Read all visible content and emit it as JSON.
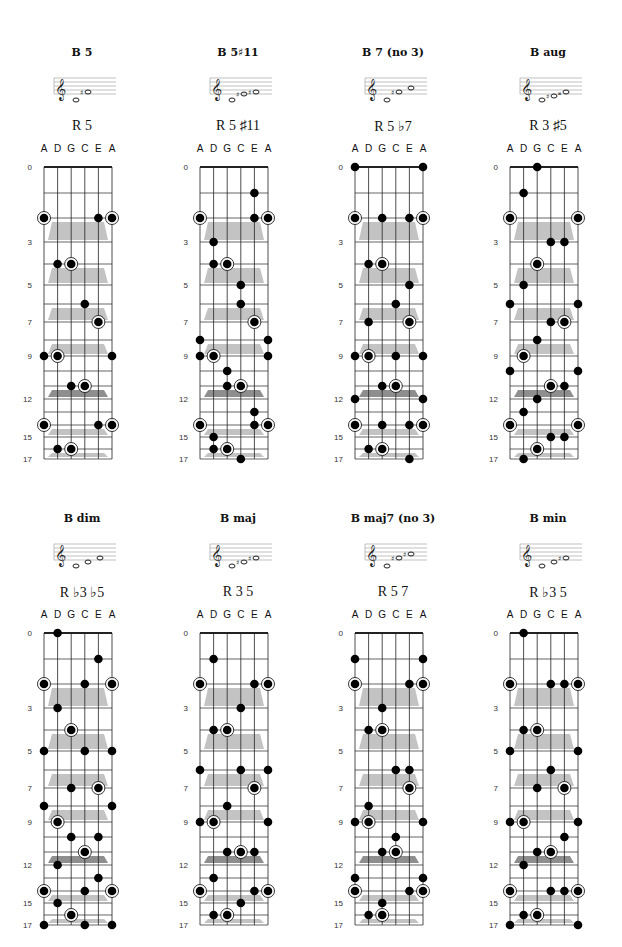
{
  "tuning": [
    "A",
    "D",
    "G",
    "C",
    "E",
    "A"
  ],
  "fret_labels": [
    0,
    3,
    5,
    7,
    9,
    12,
    15,
    17
  ],
  "colors": {
    "dot": "#000000",
    "shade": "#b8b8b8",
    "shade_dark": "#7a7a7a",
    "grid": "#222222"
  },
  "chart_data": {
    "type": "diagram",
    "charts": [
      {
        "title": "B 5",
        "formula": "R 5",
        "notes": [
          "B",
          "F#"
        ],
        "dots": [
          [
            0,
            2,
            1
          ],
          [
            4,
            2,
            0
          ],
          [
            5,
            2,
            1
          ],
          [
            1,
            4,
            0
          ],
          [
            2,
            4,
            1
          ],
          [
            3,
            6,
            0
          ],
          [
            4,
            7,
            1
          ],
          [
            0,
            9,
            0
          ],
          [
            1,
            9,
            1
          ],
          [
            5,
            9,
            0
          ],
          [
            2,
            11,
            0
          ],
          [
            3,
            11,
            1
          ],
          [
            0,
            14,
            1
          ],
          [
            4,
            14,
            0
          ],
          [
            5,
            14,
            1
          ],
          [
            1,
            16,
            0
          ],
          [
            2,
            16,
            1
          ]
        ]
      },
      {
        "title": "B 5♯11",
        "formula": "R 5 ♯11",
        "notes": [
          "B",
          "E#",
          "F#"
        ],
        "dots": [
          [
            4,
            1,
            0
          ],
          [
            0,
            2,
            1
          ],
          [
            4,
            2,
            0
          ],
          [
            5,
            2,
            1
          ],
          [
            1,
            3,
            0
          ],
          [
            1,
            4,
            0
          ],
          [
            2,
            4,
            1
          ],
          [
            3,
            5,
            0
          ],
          [
            3,
            6,
            0
          ],
          [
            4,
            7,
            1
          ],
          [
            0,
            8,
            0
          ],
          [
            5,
            8,
            0
          ],
          [
            0,
            9,
            0
          ],
          [
            1,
            9,
            1
          ],
          [
            5,
            9,
            0
          ],
          [
            2,
            10,
            0
          ],
          [
            2,
            11,
            0
          ],
          [
            3,
            11,
            1
          ],
          [
            4,
            13,
            0
          ],
          [
            0,
            14,
            1
          ],
          [
            4,
            14,
            0
          ],
          [
            5,
            14,
            1
          ],
          [
            1,
            15,
            0
          ],
          [
            1,
            16,
            0
          ],
          [
            2,
            16,
            1
          ],
          [
            3,
            17,
            0
          ]
        ]
      },
      {
        "title": "B 7 (no 3)",
        "formula": "R 5 ♭7",
        "notes": [
          "B",
          "F#",
          "A"
        ],
        "dots": [
          [
            0,
            0,
            0
          ],
          [
            5,
            0,
            0
          ],
          [
            0,
            2,
            1
          ],
          [
            2,
            2,
            0
          ],
          [
            4,
            2,
            0
          ],
          [
            5,
            2,
            1
          ],
          [
            1,
            4,
            0
          ],
          [
            2,
            4,
            1
          ],
          [
            4,
            5,
            0
          ],
          [
            3,
            6,
            0
          ],
          [
            1,
            7,
            0
          ],
          [
            4,
            7,
            1
          ],
          [
            0,
            9,
            0
          ],
          [
            1,
            9,
            1
          ],
          [
            3,
            9,
            0
          ],
          [
            5,
            9,
            0
          ],
          [
            2,
            11,
            0
          ],
          [
            3,
            11,
            1
          ],
          [
            0,
            12,
            0
          ],
          [
            5,
            12,
            0
          ],
          [
            0,
            14,
            1
          ],
          [
            2,
            14,
            0
          ],
          [
            4,
            14,
            0
          ],
          [
            5,
            14,
            1
          ],
          [
            1,
            16,
            0
          ],
          [
            2,
            16,
            1
          ],
          [
            4,
            17,
            0
          ]
        ]
      },
      {
        "title": "B aug",
        "formula": "R 3 ♯5",
        "notes": [
          "B",
          "D#",
          "F##"
        ],
        "dots": [
          [
            2,
            0,
            0
          ],
          [
            1,
            1,
            0
          ],
          [
            0,
            2,
            1
          ],
          [
            5,
            2,
            1
          ],
          [
            3,
            3,
            0
          ],
          [
            4,
            3,
            0
          ],
          [
            2,
            4,
            1
          ],
          [
            1,
            5,
            0
          ],
          [
            0,
            6,
            0
          ],
          [
            5,
            6,
            0
          ],
          [
            3,
            7,
            0
          ],
          [
            4,
            7,
            1
          ],
          [
            2,
            8,
            0
          ],
          [
            1,
            9,
            1
          ],
          [
            0,
            10,
            0
          ],
          [
            5,
            10,
            0
          ],
          [
            3,
            11,
            1
          ],
          [
            4,
            11,
            0
          ],
          [
            2,
            12,
            0
          ],
          [
            1,
            13,
            0
          ],
          [
            0,
            14,
            1
          ],
          [
            5,
            14,
            1
          ],
          [
            3,
            15,
            0
          ],
          [
            4,
            15,
            0
          ],
          [
            2,
            16,
            1
          ],
          [
            1,
            17,
            0
          ]
        ]
      },
      {
        "title": "B dim",
        "formula": "R ♭3 ♭5",
        "notes": [
          "B",
          "D",
          "F"
        ],
        "dots": [
          [
            1,
            0,
            0
          ],
          [
            4,
            1,
            0
          ],
          [
            0,
            2,
            1
          ],
          [
            3,
            2,
            0
          ],
          [
            5,
            2,
            1
          ],
          [
            1,
            3,
            0
          ],
          [
            2,
            4,
            1
          ],
          [
            0,
            5,
            0
          ],
          [
            3,
            5,
            0
          ],
          [
            5,
            5,
            0
          ],
          [
            2,
            7,
            0
          ],
          [
            4,
            7,
            1
          ],
          [
            0,
            8,
            0
          ],
          [
            5,
            8,
            0
          ],
          [
            1,
            9,
            1
          ],
          [
            2,
            10,
            0
          ],
          [
            4,
            10,
            0
          ],
          [
            3,
            11,
            1
          ],
          [
            1,
            12,
            0
          ],
          [
            4,
            13,
            0
          ],
          [
            0,
            14,
            1
          ],
          [
            3,
            14,
            0
          ],
          [
            5,
            14,
            1
          ],
          [
            1,
            15,
            0
          ],
          [
            2,
            16,
            1
          ],
          [
            0,
            17,
            0
          ],
          [
            3,
            17,
            0
          ],
          [
            5,
            17,
            0
          ]
        ]
      },
      {
        "title": "B maj",
        "formula": "R 3 5",
        "notes": [
          "B",
          "D#",
          "F#"
        ],
        "dots": [
          [
            1,
            1,
            0
          ],
          [
            0,
            2,
            1
          ],
          [
            4,
            2,
            0
          ],
          [
            5,
            2,
            1
          ],
          [
            3,
            3,
            0
          ],
          [
            1,
            4,
            0
          ],
          [
            2,
            4,
            1
          ],
          [
            0,
            6,
            0
          ],
          [
            3,
            6,
            0
          ],
          [
            5,
            6,
            0
          ],
          [
            4,
            7,
            1
          ],
          [
            2,
            8,
            0
          ],
          [
            0,
            9,
            0
          ],
          [
            1,
            9,
            1
          ],
          [
            5,
            9,
            0
          ],
          [
            2,
            11,
            0
          ],
          [
            3,
            11,
            1
          ],
          [
            4,
            11,
            0
          ],
          [
            1,
            13,
            0
          ],
          [
            0,
            14,
            1
          ],
          [
            4,
            14,
            0
          ],
          [
            5,
            14,
            1
          ],
          [
            3,
            15,
            0
          ],
          [
            1,
            16,
            0
          ],
          [
            2,
            16,
            1
          ]
        ]
      },
      {
        "title": "B maj7 (no 3)",
        "formula": "R 5 7",
        "notes": [
          "B",
          "F#",
          "A#"
        ],
        "dots": [
          [
            0,
            1,
            0
          ],
          [
            5,
            1,
            0
          ],
          [
            0,
            2,
            1
          ],
          [
            4,
            2,
            0
          ],
          [
            5,
            2,
            1
          ],
          [
            2,
            3,
            0
          ],
          [
            1,
            4,
            0
          ],
          [
            2,
            4,
            1
          ],
          [
            3,
            6,
            0
          ],
          [
            4,
            6,
            0
          ],
          [
            4,
            7,
            1
          ],
          [
            1,
            8,
            0
          ],
          [
            0,
            9,
            0
          ],
          [
            1,
            9,
            1
          ],
          [
            5,
            9,
            0
          ],
          [
            3,
            10,
            0
          ],
          [
            2,
            11,
            0
          ],
          [
            3,
            11,
            1
          ],
          [
            0,
            13,
            0
          ],
          [
            5,
            13,
            0
          ],
          [
            0,
            14,
            1
          ],
          [
            4,
            14,
            0
          ],
          [
            5,
            14,
            1
          ],
          [
            2,
            15,
            0
          ],
          [
            1,
            16,
            0
          ],
          [
            2,
            16,
            1
          ]
        ]
      },
      {
        "title": "B min",
        "formula": "R ♭3 5",
        "notes": [
          "B",
          "D",
          "F#"
        ],
        "dots": [
          [
            1,
            0,
            0
          ],
          [
            0,
            2,
            1
          ],
          [
            3,
            2,
            0
          ],
          [
            4,
            2,
            0
          ],
          [
            5,
            2,
            1
          ],
          [
            1,
            4,
            0
          ],
          [
            2,
            4,
            1
          ],
          [
            0,
            5,
            0
          ],
          [
            5,
            5,
            0
          ],
          [
            3,
            6,
            0
          ],
          [
            2,
            7,
            0
          ],
          [
            4,
            7,
            1
          ],
          [
            0,
            9,
            0
          ],
          [
            1,
            9,
            1
          ],
          [
            5,
            9,
            0
          ],
          [
            4,
            10,
            0
          ],
          [
            2,
            11,
            0
          ],
          [
            3,
            11,
            1
          ],
          [
            1,
            12,
            0
          ],
          [
            0,
            14,
            1
          ],
          [
            3,
            14,
            0
          ],
          [
            4,
            14,
            0
          ],
          [
            5,
            14,
            1
          ],
          [
            1,
            16,
            0
          ],
          [
            2,
            16,
            1
          ],
          [
            0,
            17,
            0
          ],
          [
            5,
            17,
            0
          ]
        ]
      }
    ]
  },
  "panels": [
    {
      "title": "B 5",
      "formula": "R 5"
    },
    {
      "title": "B 5♯11",
      "formula": "R 5 ♯11"
    },
    {
      "title": "B 7 (no 3)",
      "formula": "R 5 ♭7"
    },
    {
      "title": "B aug",
      "formula": "R 3 ♯5"
    },
    {
      "title": "B dim",
      "formula": "R ♭3 ♭5"
    },
    {
      "title": "B maj",
      "formula": "R 3 5"
    },
    {
      "title": "B maj7 (no 3)",
      "formula": "R 5 7"
    },
    {
      "title": "B min",
      "formula": "R ♭3 5"
    }
  ]
}
